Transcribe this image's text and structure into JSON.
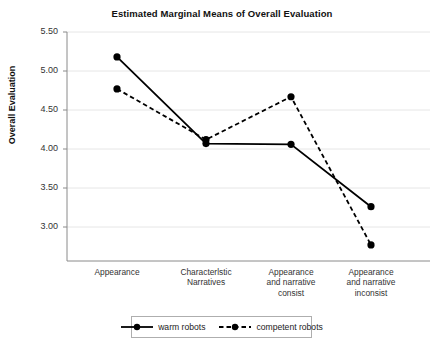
{
  "chart_data": {
    "type": "line",
    "title": "Estimated Marginal Means of Overall Evaluation",
    "xlabel": "",
    "ylabel": "Overall Evaluation",
    "categories": [
      "Appearance",
      "Characterlstic Narratives",
      "Appearance and narrative consist",
      "Appearance and narrative inconsist"
    ],
    "category_lines": [
      [
        "Appearance"
      ],
      [
        "Characterlstic",
        "Narratives"
      ],
      [
        "Appearance",
        "and narrative",
        "consist"
      ],
      [
        "Appearance",
        "and narrative",
        "inconsist"
      ]
    ],
    "yticks": [
      "5.50",
      "5.00",
      "4.50",
      "4.00",
      "3.50",
      "3.00"
    ],
    "ytick_values": [
      5.5,
      5.0,
      4.5,
      4.0,
      3.5,
      3.0
    ],
    "ylim": [
      2.62,
      5.62
    ],
    "grid": true,
    "legend_position": "bottom",
    "series": [
      {
        "name": "warm robots",
        "style": "solid",
        "marker": "circle",
        "color": "#000000",
        "values": [
          5.18,
          4.07,
          4.06,
          3.26
        ]
      },
      {
        "name": "competent robots",
        "style": "dashed",
        "marker": "circle",
        "color": "#000000",
        "values": [
          4.77,
          4.12,
          4.67,
          2.77
        ]
      }
    ]
  }
}
